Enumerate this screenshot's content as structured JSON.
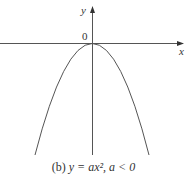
{
  "figure": {
    "axis_labels": {
      "x": "x",
      "y": "y",
      "origin": "0"
    },
    "caption": {
      "prefix": "(b)",
      "equation": "y = ax², a < 0"
    },
    "curve": {
      "type": "parabola",
      "equation": "y = ax^2",
      "condition": "a < 0",
      "opens": "down",
      "vertex": [
        0,
        0
      ]
    },
    "colors": {
      "stroke": "#555555",
      "text": "#333333",
      "background": "#ffffff"
    }
  }
}
